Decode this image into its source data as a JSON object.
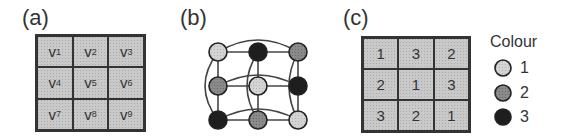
{
  "panels": {
    "a": {
      "label": "(a)",
      "cells": [
        {
          "var": "v",
          "sub": "1"
        },
        {
          "var": "v",
          "sub": "2"
        },
        {
          "var": "v",
          "sub": "3"
        },
        {
          "var": "v",
          "sub": "4"
        },
        {
          "var": "v",
          "sub": "5"
        },
        {
          "var": "v",
          "sub": "6"
        },
        {
          "var": "v",
          "sub": "7"
        },
        {
          "var": "v",
          "sub": "8"
        },
        {
          "var": "v",
          "sub": "9"
        }
      ]
    },
    "b": {
      "label": "(b)",
      "nodes": [
        {
          "id": 1,
          "colour": 1
        },
        {
          "id": 2,
          "colour": 3
        },
        {
          "id": 3,
          "colour": 2
        },
        {
          "id": 4,
          "colour": 2
        },
        {
          "id": 5,
          "colour": 1
        },
        {
          "id": 6,
          "colour": 3
        },
        {
          "id": 7,
          "colour": 3
        },
        {
          "id": 8,
          "colour": 2
        },
        {
          "id": 9,
          "colour": 1
        }
      ]
    },
    "c": {
      "label": "(c)",
      "values": [
        "1",
        "3",
        "2",
        "2",
        "1",
        "3",
        "3",
        "2",
        "1"
      ]
    }
  },
  "legend": {
    "title": "Colour",
    "items": [
      {
        "label": "1",
        "fill": "#d4d4d4"
      },
      {
        "label": "2",
        "fill": "#8a8a8a"
      },
      {
        "label": "3",
        "fill": "#1e1e1e"
      }
    ]
  },
  "colors": {
    "colour1": "#d4d4d4",
    "colour2": "#8a8a8a",
    "colour3": "#1e1e1e",
    "stroke": "#333333"
  }
}
